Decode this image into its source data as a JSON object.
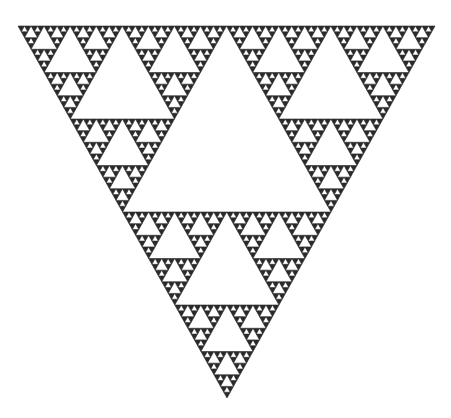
{
  "figure": {
    "type": "sierpinski-triangle",
    "orientation": "inverted",
    "recursion_depth": 6,
    "colors": {
      "ink": "#2a2a2a",
      "background": "#ffffff"
    }
  }
}
